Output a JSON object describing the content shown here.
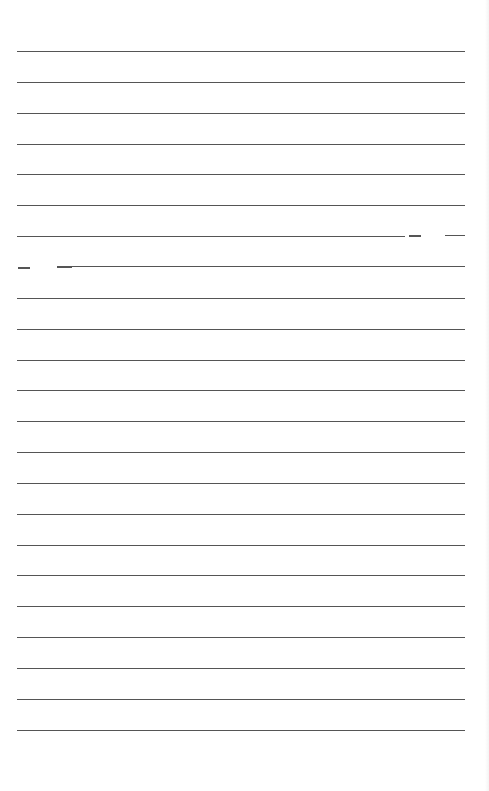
{
  "page": {
    "type": "lined-paper",
    "background": "#ffffff",
    "line_color": "#555555",
    "line_count": 23,
    "first_line_y": 51,
    "line_spacing": 30.85,
    "line_left": 17,
    "line_width": 448
  },
  "broken_lines": [
    {
      "index": 6,
      "segments": [
        [
          17,
          405
        ],
        [
          409,
          421
        ],
        [
          445,
          465
        ]
      ]
    },
    {
      "index": 7,
      "segments": [
        [
          18,
          30
        ],
        [
          57,
          72
        ],
        [
          72,
          465
        ]
      ]
    }
  ]
}
